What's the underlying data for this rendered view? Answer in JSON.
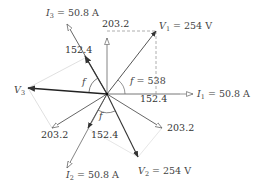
{
  "diagram": {
    "type": "phasor-diagram",
    "origin": [
      107,
      94
    ],
    "labels": {
      "V1": "V",
      "V1_sub": "1",
      "V1_val": " = 254 V",
      "V2": "V",
      "V2_sub": "2",
      "V2_val": " = 254 V",
      "V3": "V",
      "V3_sub": "3",
      "I1": "I",
      "I1_sub": "1",
      "I1_val": " = 50.8 A",
      "I2": "I",
      "I2_sub": "2",
      "I2_val": " = 50.8 A",
      "I3": "I",
      "I3_sub": "3",
      "I3_val": " = 50.8 A",
      "phi_angle": "f = 53.8",
      "phi_left": "f",
      "phi_bottom": "f",
      "comp_top": "203.2",
      "comp_right": "152.4",
      "comp_i3": "152.4",
      "comp_lower_left": "203.2",
      "comp_i2": "152.4",
      "comp_lower_right": "203.2"
    },
    "phasors": [
      {
        "name": "V1",
        "magnitude": "254 V",
        "angle_deg": 52,
        "style": "solid-arrow"
      },
      {
        "name": "V2",
        "magnitude": "254 V",
        "angle_deg": -68,
        "style": "solid-arrow"
      },
      {
        "name": "V3",
        "magnitude": "254 V",
        "angle_deg": 172,
        "style": "solid-arrow"
      },
      {
        "name": "I1",
        "magnitude": "50.8 A",
        "angle_deg": 0,
        "style": "hollow-arrow"
      },
      {
        "name": "I2",
        "magnitude": "50.8 A",
        "angle_deg": -120,
        "style": "hollow-arrow"
      },
      {
        "name": "I3",
        "magnitude": "50.8 A",
        "angle_deg": 120,
        "style": "hollow-arrow"
      }
    ],
    "components": [
      "203.2",
      "152.4",
      "152.4",
      "203.2",
      "152.4",
      "203.2"
    ],
    "colors": {
      "voltage": "#333333",
      "current": "#666666",
      "dashed": "#999999",
      "construction": "#cccccc"
    }
  }
}
